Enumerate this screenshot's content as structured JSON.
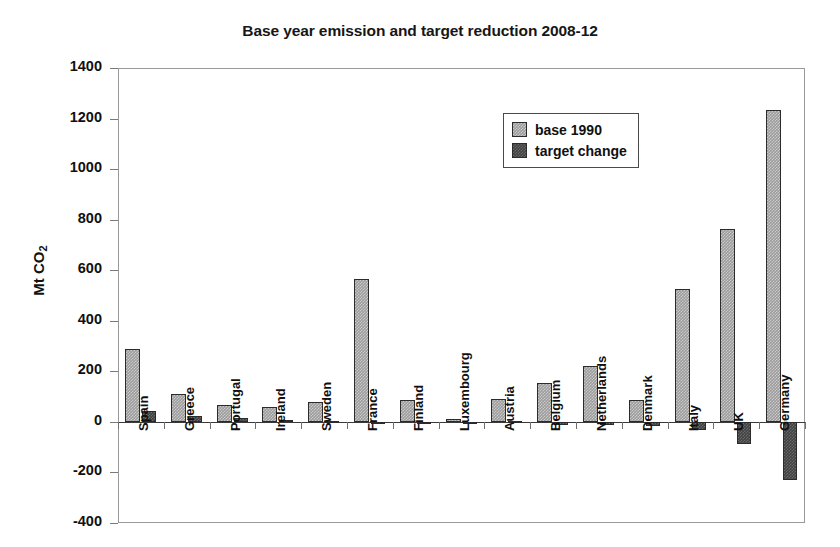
{
  "chart_data": {
    "type": "bar",
    "title": "Base year emission and target reduction 2008-12",
    "xlabel": "",
    "ylabel": "Mt CO2",
    "ylabel_prefix": "Mt CO",
    "ylabel_sub": "2",
    "ylim": [
      -400,
      1400
    ],
    "ytick_step": 200,
    "yticks": [
      1400,
      1200,
      1000,
      800,
      600,
      400,
      200,
      0,
      -200,
      -400
    ],
    "ytick_labels": [
      "1400",
      "1200",
      "1000",
      "800",
      "600",
      "400",
      "200",
      "0",
      "-200",
      "-400"
    ],
    "grid": false,
    "legend_position": "upper center",
    "categories": [
      "Spain",
      "Greece",
      "Portugal",
      "Ireland",
      "Sweden",
      "France",
      "Finland",
      "Luxembourg",
      "Austria",
      "Belgium",
      "Netherlands",
      "Denmark",
      "Italy",
      "UK",
      "Germany"
    ],
    "series": [
      {
        "name": "base 1990",
        "color": "#9c9c9c",
        "values": [
          290,
          110,
          65,
          57,
          80,
          565,
          87,
          13,
          90,
          152,
          222,
          85,
          525,
          765,
          1235
        ]
      },
      {
        "name": "target change",
        "color": "#414141",
        "values": [
          44,
          25,
          17,
          8,
          3,
          0,
          0,
          -3,
          2,
          -11,
          -13,
          -18,
          -33,
          -88,
          -230
        ]
      }
    ]
  },
  "legend": {
    "items": [
      {
        "label": "base 1990",
        "swatch": "base"
      },
      {
        "label": "target change",
        "swatch": "target"
      }
    ]
  }
}
